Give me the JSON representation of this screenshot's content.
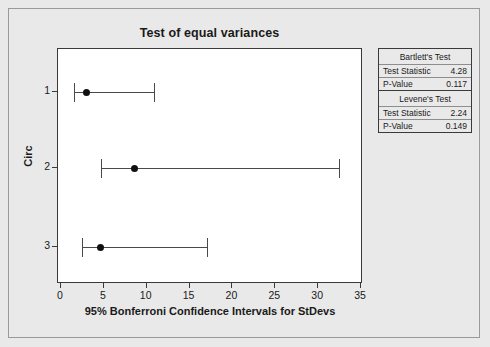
{
  "chart_data": {
    "type": "scatter",
    "title": "Test of equal variances",
    "xlabel": "95% Bonferroni Confidence Intervals for StDevs",
    "ylabel": "Circ",
    "xlim": [
      0,
      35
    ],
    "xticks": [
      "0",
      "5",
      "10",
      "15",
      "20",
      "25",
      "30",
      "35"
    ],
    "xtick_values": [
      0,
      5,
      10,
      15,
      20,
      25,
      30,
      35
    ],
    "categories": [
      "1",
      "2",
      "3"
    ],
    "grid": false,
    "legend": "none",
    "series": [
      {
        "name": "95% Bonferroni CI for StDev",
        "points": [
          {
            "category": "1",
            "center": 3.0,
            "lower": 1.5,
            "upper": 10.8
          },
          {
            "category": "2",
            "center": 8.6,
            "lower": 4.7,
            "upper": 32.4
          },
          {
            "category": "3",
            "center": 4.6,
            "lower": 2.5,
            "upper": 17.0
          }
        ]
      }
    ]
  },
  "stats_table": {
    "blocks": [
      {
        "header": "Bartlett's Test",
        "rows": [
          {
            "label": "Test Statistic",
            "value": "4.28"
          },
          {
            "label": "P-Value",
            "value": "0.117"
          }
        ]
      },
      {
        "header": "Levene's Test",
        "rows": [
          {
            "label": "Test Statistic",
            "value": "2.24"
          },
          {
            "label": "P-Value",
            "value": "0.149"
          }
        ]
      }
    ]
  },
  "colors": {
    "background": "#e9e9e9",
    "plot_background": "#ffffff",
    "axis": "#3a3a3a",
    "marker": "#111111",
    "interval_line": "#4a4a4a"
  }
}
